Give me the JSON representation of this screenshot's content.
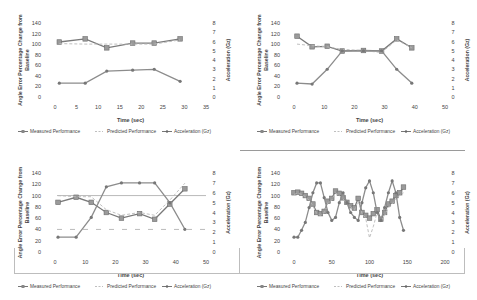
{
  "common": {
    "y_left_label_line1": "Angle Error Percentage Change from",
    "y_left_label_line2": "Baseline",
    "y_right_label": "Acceleration (Gz)",
    "x_label": "Time (sec)",
    "legend": [
      "Measured Performance",
      "Predicted Performance",
      "Acceleration (Gz)"
    ],
    "colors": {
      "measured": "#7a7a7a",
      "predicted": "#b8b8b8",
      "acceleration": "#8c8c8c",
      "axis_text": "#444444"
    }
  },
  "chart_data": [
    {
      "type": "line",
      "title": "",
      "xlabel": "Time (sec)",
      "ylabel": "Angle Error Percentage Change from Baseline",
      "y2label": "Acceleration (Gz)",
      "xlim": [
        0,
        35
      ],
      "xticks": [
        0,
        5,
        10,
        15,
        20,
        25,
        30,
        35
      ],
      "ylim": [
        0,
        140
      ],
      "yticks": [
        0,
        20,
        40,
        60,
        80,
        100,
        120,
        140
      ],
      "y2lim": [
        0,
        8
      ],
      "y2ticks": [
        0,
        1,
        2,
        3,
        4,
        5,
        6,
        7,
        8
      ],
      "grid": false,
      "legend_position": "bottom",
      "series": [
        {
          "name": "Measured Performance",
          "axis": "left",
          "x": [
            1,
            7,
            12,
            18,
            23,
            29
          ],
          "values": [
            104,
            110,
            93,
            102,
            102,
            110
          ]
        },
        {
          "name": "Predicted Performance",
          "axis": "left",
          "x": [
            1,
            7,
            12,
            18,
            23,
            29
          ],
          "values": [
            101,
            100,
            100,
            100,
            100,
            108
          ]
        },
        {
          "name": "Acceleration (Gz)",
          "axis": "right",
          "x": [
            1,
            7,
            12,
            18,
            23,
            29
          ],
          "values": [
            1.5,
            1.5,
            2.8,
            2.9,
            3.0,
            1.7
          ]
        }
      ]
    },
    {
      "type": "line",
      "title": "",
      "xlabel": "Time (sec)",
      "ylabel": "Angle Error Percentage Change from Baseline",
      "y2label": "Acceleration (Gz)",
      "xlim": [
        0,
        50
      ],
      "xticks": [
        0,
        10,
        20,
        30,
        40,
        50
      ],
      "ylim": [
        0,
        140
      ],
      "yticks": [
        0,
        20,
        40,
        60,
        80,
        100,
        120,
        140
      ],
      "y2lim": [
        0,
        8
      ],
      "y2ticks": [
        0,
        1,
        2,
        3,
        4,
        5,
        6,
        7,
        8
      ],
      "grid": false,
      "legend_position": "bottom",
      "series": [
        {
          "name": "Measured Performance",
          "axis": "left",
          "x": [
            1,
            6,
            11,
            16,
            23,
            29,
            34,
            39
          ],
          "values": [
            115,
            95,
            96,
            87,
            88,
            87,
            110,
            93
          ]
        },
        {
          "name": "Predicted Performance",
          "axis": "left",
          "x": [
            1,
            6,
            11,
            16,
            23,
            29,
            34,
            39
          ],
          "values": [
            100,
            97,
            95,
            90,
            88,
            84,
            108,
            93
          ]
        },
        {
          "name": "Acceleration (Gz)",
          "axis": "right",
          "x": [
            1,
            6,
            11,
            16,
            23,
            29,
            34,
            39
          ],
          "values": [
            1.5,
            1.4,
            3.0,
            5.0,
            5.0,
            5.0,
            3.0,
            1.5
          ]
        }
      ]
    },
    {
      "type": "line",
      "title": "",
      "xlabel": "Time (sec)",
      "ylabel": "Angle Error Percentage Change from Baseline",
      "y2label": "Acceleration (Gz)",
      "xlim": [
        0,
        50
      ],
      "xticks": [
        0,
        10,
        20,
        30,
        40,
        50
      ],
      "ylim": [
        0,
        140
      ],
      "yticks": [
        0,
        20,
        40,
        60,
        80,
        100,
        120,
        140
      ],
      "y2lim": [
        0,
        8
      ],
      "y2ticks": [
        0,
        1,
        2,
        3,
        4,
        5,
        6,
        7,
        8
      ],
      "grid": false,
      "legend_position": "bottom",
      "reference_lines": [
        {
          "axis": "left",
          "value": 100,
          "style": "solid"
        },
        {
          "axis": "left",
          "value": 40,
          "style": "dashed"
        }
      ],
      "series": [
        {
          "name": "Measured Performance",
          "axis": "left",
          "x": [
            1,
            7,
            12,
            17,
            22,
            28,
            33,
            38,
            43
          ],
          "values": [
            88,
            97,
            88,
            70,
            60,
            68,
            58,
            85,
            112
          ]
        },
        {
          "name": "Predicted Performance",
          "axis": "left",
          "x": [
            1,
            7,
            12,
            17,
            22,
            28,
            33,
            38,
            43
          ],
          "values": [
            100,
            98,
            98,
            75,
            65,
            70,
            65,
            92,
            122
          ]
        },
        {
          "name": "Acceleration (Gz)",
          "axis": "right",
          "x": [
            1,
            7,
            12,
            17,
            22,
            28,
            33,
            38,
            43
          ],
          "values": [
            1.5,
            1.5,
            3.5,
            6.6,
            7.0,
            7.0,
            7.0,
            5.0,
            2.3
          ]
        }
      ]
    },
    {
      "type": "line",
      "title": "",
      "xlabel": "Time (sec)",
      "ylabel": "Angle Error Percentage Change from Baseline",
      "y2label": "Acceleration (Gz)",
      "xlim": [
        0,
        200
      ],
      "xticks": [
        0,
        50,
        100,
        150,
        200
      ],
      "ylim": [
        0,
        140
      ],
      "yticks": [
        0,
        20,
        40,
        60,
        80,
        100,
        120,
        140
      ],
      "y2lim": [
        0,
        8
      ],
      "y2ticks": [
        0,
        1,
        2,
        3,
        4,
        5,
        6,
        7,
        8
      ],
      "grid": false,
      "legend_position": "bottom",
      "series": [
        {
          "name": "Measured Performance",
          "axis": "left",
          "x": [
            0,
            5,
            10,
            15,
            20,
            25,
            30,
            35,
            40,
            45,
            50,
            55,
            60,
            65,
            70,
            75,
            80,
            85,
            90,
            95,
            100,
            105,
            110,
            115,
            120,
            125,
            130,
            135,
            140,
            145
          ],
          "values": [
            105,
            106,
            104,
            100,
            95,
            85,
            70,
            68,
            72,
            90,
            95,
            108,
            104,
            96,
            88,
            82,
            78,
            95,
            70,
            65,
            60,
            68,
            75,
            58,
            70,
            85,
            90,
            100,
            105,
            115
          ]
        },
        {
          "name": "Predicted Performance",
          "axis": "left",
          "x": [
            0,
            5,
            10,
            15,
            20,
            25,
            30,
            35,
            40,
            45,
            50,
            55,
            60,
            65,
            70,
            75,
            80,
            85,
            90,
            95,
            100,
            105,
            110,
            115,
            120,
            125,
            130,
            135,
            140,
            145
          ],
          "values": [
            102,
            104,
            102,
            98,
            92,
            82,
            68,
            65,
            70,
            88,
            92,
            105,
            100,
            94,
            86,
            80,
            75,
            90,
            68,
            60,
            25,
            45,
            70,
            55,
            65,
            78,
            85,
            95,
            100,
            105
          ]
        },
        {
          "name": "Acceleration (Gz)",
          "axis": "right",
          "x": [
            0,
            5,
            10,
            15,
            20,
            25,
            30,
            35,
            40,
            45,
            50,
            55,
            60,
            65,
            70,
            75,
            80,
            85,
            90,
            95,
            100,
            105,
            110,
            115,
            120,
            125,
            130,
            135,
            140,
            145
          ],
          "values": [
            1.5,
            1.5,
            2.2,
            3.0,
            4.5,
            6.0,
            7.0,
            7.0,
            5.5,
            4.0,
            3.2,
            3.5,
            5.0,
            6.0,
            5.0,
            4.0,
            3.5,
            3.2,
            5.0,
            6.5,
            7.2,
            6.0,
            4.0,
            3.2,
            4.5,
            6.0,
            7.2,
            6.0,
            3.5,
            2.2
          ]
        }
      ]
    }
  ]
}
